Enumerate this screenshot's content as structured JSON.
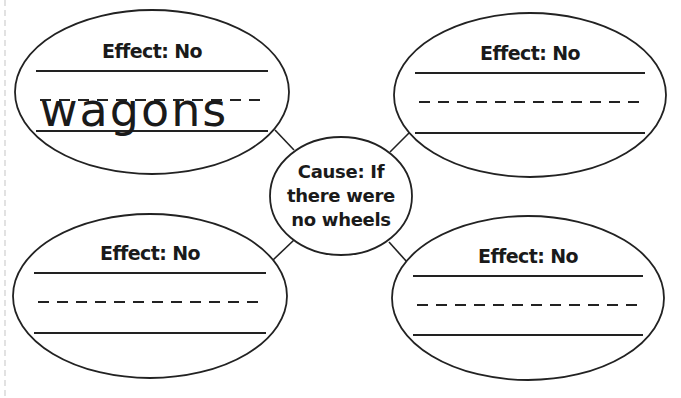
{
  "diagram": {
    "type": "cause-and-effect web",
    "cause": {
      "line1": "Cause: If",
      "line2": "there were",
      "line3": "no wheels"
    },
    "effects": [
      {
        "position": "top-left",
        "label": "Effect: No",
        "answer": "wagons"
      },
      {
        "position": "top-right",
        "label": "Effect: No",
        "answer": ""
      },
      {
        "position": "bottom-left",
        "label": "Effect: No",
        "answer": ""
      },
      {
        "position": "bottom-right",
        "label": "Effect: No",
        "answer": ""
      }
    ],
    "colors": {
      "stroke": "#222222",
      "background": "#ffffff",
      "margin_guide": "#dddddd"
    }
  }
}
